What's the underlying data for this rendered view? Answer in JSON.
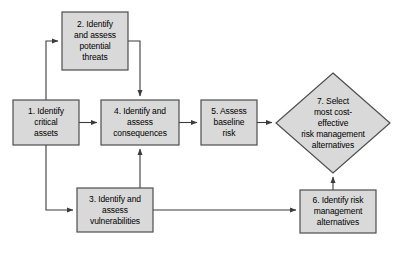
{
  "diagram": {
    "type": "flowchart",
    "background_color": "#ffffff",
    "node_fill_color": "#d9d9d9",
    "node_border_color": "#4d4d4d",
    "connector_color": "#3b3b3b",
    "text_color": "#000000"
  },
  "nodes": [
    {
      "id": "node1",
      "shape": "rectangle",
      "label": "1. Identify critical assets",
      "lines": [
        "1. Identify",
        "critical",
        "assets"
      ],
      "x": 13,
      "y": 100,
      "w": 66,
      "h": 45
    },
    {
      "id": "node2",
      "shape": "rectangle",
      "label": "2. Identify and assess potential threats",
      "lines": [
        "2. Identify",
        "and assess",
        "potential",
        "threats"
      ],
      "x": 62,
      "y": 12,
      "w": 66,
      "h": 58
    },
    {
      "id": "node3",
      "shape": "rectangle",
      "label": "3. Identify and assess vulnerabilities",
      "lines": [
        "3. Identify and",
        "assess",
        "vulnerabilities"
      ],
      "x": 77,
      "y": 188,
      "w": 76,
      "h": 44
    },
    {
      "id": "node4",
      "shape": "rectangle",
      "label": "4. Identify and assess consequences",
      "lines": [
        "4. Identify and",
        "assess",
        "consequences"
      ],
      "x": 101,
      "y": 100,
      "w": 78,
      "h": 45
    },
    {
      "id": "node5",
      "shape": "rectangle",
      "label": "5. Assess baseline risk",
      "lines": [
        "5. Assess",
        "baseline",
        "risk"
      ],
      "x": 201,
      "y": 100,
      "w": 56,
      "h": 45
    },
    {
      "id": "node6",
      "shape": "rectangle",
      "label": "6. Identify risk management alternatives",
      "lines": [
        "6. Identify risk",
        "management",
        "alternatives"
      ],
      "x": 300,
      "y": 190,
      "w": 76,
      "h": 43
    },
    {
      "id": "node7",
      "shape": "diamond",
      "label": "7. Select most cost-effective risk management alternatives",
      "lines": [
        "7. Select",
        "most cost-",
        "effective",
        "risk management",
        "alternatives"
      ],
      "cx": 333,
      "cy": 123,
      "rx": 57,
      "ry": 50
    }
  ],
  "edges": [
    {
      "id": "edge-1-to-2",
      "from": "node1",
      "to": "node2",
      "arrow": true
    },
    {
      "id": "edge-2-to-4",
      "from": "node2",
      "to": "node4",
      "arrow": true
    },
    {
      "id": "edge-1-to-4",
      "from": "node1",
      "to": "node4",
      "arrow": true
    },
    {
      "id": "edge-1-to-3",
      "from": "node1",
      "to": "node3",
      "arrow": true
    },
    {
      "id": "edge-3-to-4",
      "from": "node3",
      "to": "node4",
      "arrow": true
    },
    {
      "id": "edge-4-to-5",
      "from": "node4",
      "to": "node5",
      "arrow": true
    },
    {
      "id": "edge-5-to-7",
      "from": "node5",
      "to": "node7",
      "arrow": true
    },
    {
      "id": "edge-3-to-6",
      "from": "node3",
      "to": "node6",
      "arrow": true
    },
    {
      "id": "edge-6-to-7",
      "from": "node6",
      "to": "node7",
      "arrow": true
    }
  ]
}
